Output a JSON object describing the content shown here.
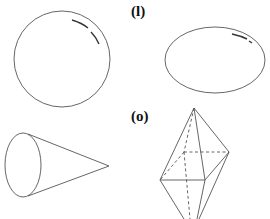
{
  "labels": {
    "l": "(l)",
    "o": "(o)"
  },
  "figures": [
    {
      "id": "sphere",
      "shape": "circle"
    },
    {
      "id": "ellipsoid",
      "shape": "ellipse"
    },
    {
      "id": "cone",
      "shape": "cone"
    },
    {
      "id": "bipyramid",
      "shape": "square bipyramid"
    }
  ],
  "colors": {
    "stroke": "#555555",
    "highlight": "#333333",
    "background": "#ffffff"
  }
}
